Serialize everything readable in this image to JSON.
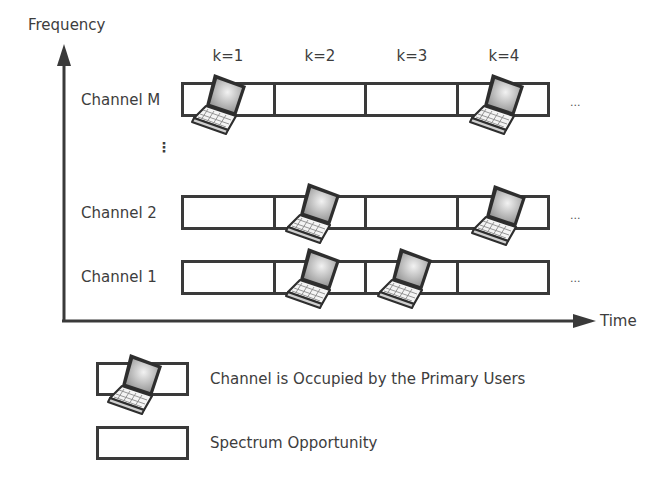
{
  "axes": {
    "y_label": "Frequency",
    "x_label": "Time"
  },
  "time_slots": [
    {
      "label": "k=1"
    },
    {
      "label": "k=2"
    },
    {
      "label": "k=3"
    },
    {
      "label": "k=4"
    }
  ],
  "channels": [
    {
      "label": "Channel M",
      "occupied": [
        true,
        false,
        false,
        true
      ],
      "continuation": "..."
    },
    {
      "label": "Channel 2",
      "occupied": [
        false,
        true,
        false,
        true
      ],
      "continuation": "..."
    },
    {
      "label": "Channel 1",
      "occupied": [
        false,
        true,
        true,
        false
      ],
      "continuation": "..."
    }
  ],
  "vertical_ellipsis": "⋮",
  "legend": [
    {
      "icon": "laptop-icon",
      "label": "Channel is Occupied by the Primary Users"
    },
    {
      "icon": "empty-box",
      "label": "Spectrum Opportunity"
    }
  ],
  "colors": {
    "line": "#3a3a3a",
    "text": "#3d3d3d",
    "background": "#ffffff"
  }
}
